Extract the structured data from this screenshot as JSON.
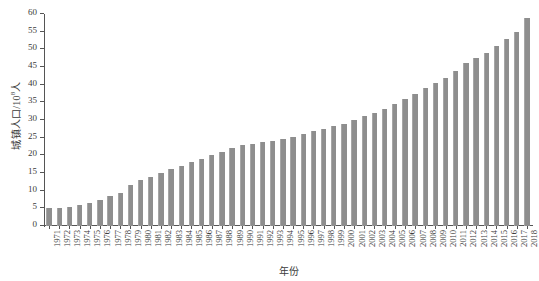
{
  "chart_data": {
    "type": "bar",
    "title": "",
    "xlabel": "年份",
    "ylabel": "城镇人口/10⁸人",
    "ylabel_base": "城镇人口/10",
    "ylabel_exponent": "8",
    "ylabel_unit": "人",
    "ylim": [
      0,
      60
    ],
    "ytick_step": 5,
    "grid": false,
    "legend": null,
    "bar_color": "#8e8e8e",
    "axis_color": "#555555",
    "text_color": "#3b3b3b",
    "yticks": [
      0,
      5,
      10,
      15,
      20,
      25,
      30,
      35,
      40,
      45,
      50,
      55,
      60
    ],
    "categories": [
      "1971",
      "1972",
      "1973",
      "1974",
      "1975",
      "1976",
      "1977",
      "1978",
      "1979",
      "1980",
      "1981",
      "1982",
      "1983",
      "1984",
      "1985",
      "1986",
      "1987",
      "1988",
      "1989",
      "1990",
      "1991",
      "1992",
      "1993",
      "1994",
      "1995",
      "1996",
      "1997",
      "1998",
      "1999",
      "2000",
      "2001",
      "2002",
      "2003",
      "2004",
      "2005",
      "2006",
      "2007",
      "2008",
      "2009",
      "2010",
      "2011",
      "2012",
      "2013",
      "2014",
      "2015",
      "2016",
      "2017",
      "2018"
    ],
    "values": [
      5.0,
      5.1,
      5.3,
      5.6,
      6.0,
      6.6,
      7.5,
      8.5,
      9.5,
      11.0,
      12.0,
      13.0,
      14.0,
      15.0,
      16.0,
      17.0,
      17.8,
      18.6,
      19.3,
      20.0,
      20.6,
      21.2,
      21.8,
      22.4,
      23.0,
      23.7,
      24.4,
      25.0,
      25.8,
      26.6,
      27.4,
      28.2,
      29.0,
      29.8,
      30.6,
      31.4,
      32.2,
      33.2,
      34.2,
      35.2,
      36.2,
      37.0,
      38.0,
      39.0,
      40.0,
      41.0,
      42.0,
      43.0
    ],
    "values_scaled_note": "bar heights read against 0-60 axis",
    "actual_values": [
      5.0,
      5.2,
      5.5,
      5.9,
      6.6,
      7.5,
      8.4,
      9.4,
      11.5,
      13.0,
      14.0,
      15.0,
      16.0,
      17.0,
      18.0,
      19.0,
      20.0,
      21.0,
      22.0,
      23.0,
      23.3,
      23.7,
      24.1,
      24.5,
      25.1,
      26.0,
      26.8,
      27.5,
      28.3,
      29.0,
      30.0,
      31.0,
      32.0,
      33.0,
      34.5,
      36.0,
      37.5,
      39.0,
      40.5,
      42.0,
      44.0,
      46.0,
      47.5,
      49.0,
      51.0,
      53.0,
      55.0,
      59.0
    ]
  }
}
